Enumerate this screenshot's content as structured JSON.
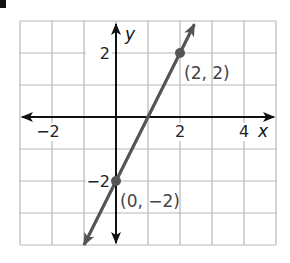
{
  "chart_data": {
    "type": "line",
    "title": "",
    "xlabel": "x",
    "ylabel": "y",
    "xlim": [
      -3,
      5
    ],
    "ylim": [
      -4,
      3
    ],
    "grid": true,
    "x_ticks_labeled": [
      -2,
      2,
      4
    ],
    "y_ticks_labeled": [
      -2,
      2
    ],
    "x_tick_labels": [
      "−2",
      "2",
      "4"
    ],
    "y_tick_labels": [
      "−2",
      "2"
    ],
    "series": [
      {
        "name": "line",
        "equation": "y = 2x - 2",
        "slope": 2,
        "intercept": -2,
        "x": [
          -1,
          2.45
        ],
        "y": [
          -4,
          2.9
        ],
        "color": "#555555",
        "arrows": "both"
      }
    ],
    "points": [
      {
        "x": 2,
        "y": 2,
        "label": "(2, 2)"
      },
      {
        "x": 0,
        "y": -2,
        "label": "(0, −2)"
      }
    ]
  },
  "colors": {
    "grid": "#b8b8b8",
    "axis": "#111111",
    "line": "#555555",
    "label": "#444444"
  }
}
